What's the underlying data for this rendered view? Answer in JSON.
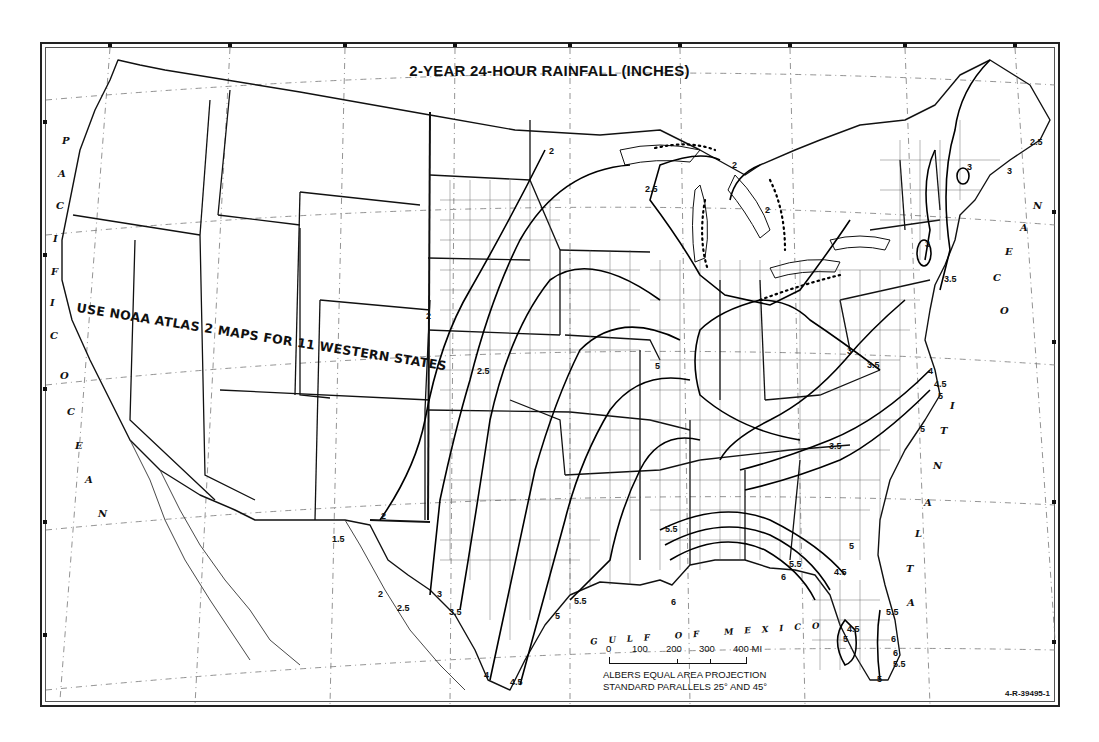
{
  "map": {
    "title": "2-YEAR 24-HOUR RAINFALL (INCHES)",
    "note": "USE NOAA ATLAS 2 MAPS FOR 11 WESTERN STATES",
    "oceans": {
      "pacific": [
        "P",
        "A",
        "C",
        "I",
        "F",
        "I",
        "C"
      ],
      "pacific_ocean": [
        "O",
        "C",
        "E",
        "A",
        "N"
      ],
      "atlantic": [
        "A",
        "T",
        "L",
        "A",
        "N",
        "T",
        "I",
        "C"
      ],
      "atlantic_ocean": [
        "O",
        "C",
        "E",
        "A",
        "N"
      ],
      "gulf": "GULF OF MEXICO"
    },
    "scale": {
      "labels": [
        "0",
        "100",
        "200",
        "300",
        "400 MI"
      ]
    },
    "projection": {
      "line1": "ALBERS EQUAL AREA PROJECTION",
      "line2": "STANDARD PARALLELS 25° AND 45°"
    },
    "figure_code": "4-R-39495-1",
    "contour_labels": [
      {
        "value": "2",
        "x": 549,
        "y": 152
      },
      {
        "value": "2",
        "x": 732,
        "y": 166
      },
      {
        "value": "2",
        "x": 765,
        "y": 211
      },
      {
        "value": "2.5",
        "x": 645,
        "y": 190
      },
      {
        "value": "2",
        "x": 426,
        "y": 317
      },
      {
        "value": "2.5",
        "x": 477,
        "y": 372
      },
      {
        "value": "2",
        "x": 381,
        "y": 517
      },
      {
        "value": "1.5",
        "x": 332,
        "y": 540
      },
      {
        "value": "2",
        "x": 378,
        "y": 595
      },
      {
        "value": "2.5",
        "x": 397,
        "y": 609
      },
      {
        "value": "3",
        "x": 437,
        "y": 595
      },
      {
        "value": "3.5",
        "x": 449,
        "y": 613
      },
      {
        "value": "4",
        "x": 484,
        "y": 676
      },
      {
        "value": "4.5",
        "x": 510,
        "y": 683
      },
      {
        "value": "5",
        "x": 555,
        "y": 617
      },
      {
        "value": "5.5",
        "x": 574,
        "y": 602
      },
      {
        "value": "5",
        "x": 655,
        "y": 367
      },
      {
        "value": "5.5",
        "x": 665,
        "y": 530
      },
      {
        "value": "6",
        "x": 671,
        "y": 603
      },
      {
        "value": "6",
        "x": 781,
        "y": 578
      },
      {
        "value": "5.5",
        "x": 789,
        "y": 565
      },
      {
        "value": "4.5",
        "x": 834,
        "y": 573
      },
      {
        "value": "5",
        "x": 849,
        "y": 547
      },
      {
        "value": "5.5",
        "x": 886,
        "y": 613
      },
      {
        "value": "6",
        "x": 891,
        "y": 640
      },
      {
        "value": "6",
        "x": 893,
        "y": 654
      },
      {
        "value": "5.5",
        "x": 893,
        "y": 665
      },
      {
        "value": "5",
        "x": 877,
        "y": 680
      },
      {
        "value": "5",
        "x": 843,
        "y": 640
      },
      {
        "value": "4.5",
        "x": 847,
        "y": 630
      },
      {
        "value": "3.5",
        "x": 829,
        "y": 447
      },
      {
        "value": "3",
        "x": 847,
        "y": 352
      },
      {
        "value": "3.5",
        "x": 867,
        "y": 366
      },
      {
        "value": "4",
        "x": 928,
        "y": 372
      },
      {
        "value": "4.5",
        "x": 934,
        "y": 385
      },
      {
        "value": "5",
        "x": 938,
        "y": 397
      },
      {
        "value": "5",
        "x": 920,
        "y": 430
      },
      {
        "value": "3.5",
        "x": 944,
        "y": 280
      },
      {
        "value": "3",
        "x": 967,
        "y": 168
      },
      {
        "value": "3",
        "x": 1007,
        "y": 172
      },
      {
        "value": "2.5",
        "x": 1030,
        "y": 143
      },
      {
        "value": "3",
        "x": 925,
        "y": 245
      }
    ]
  }
}
